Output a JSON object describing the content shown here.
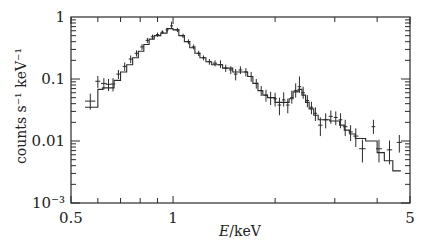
{
  "chart_data": {
    "type": "scatter",
    "title": "",
    "xlabel": "E/keV",
    "xlabel_italic": "E",
    "xlabel_unit": "/keV",
    "ylabel": "counts s⁻¹ keV⁻¹",
    "xscale": "log",
    "yscale": "log",
    "xlim": [
      0.5,
      5
    ],
    "ylim": [
      0.001,
      1
    ],
    "x_tick_labels": [
      {
        "value": 0.5,
        "label": "0.5"
      },
      {
        "value": 1,
        "label": "1"
      },
      {
        "value": 5,
        "label": "5"
      }
    ],
    "y_tick_labels": [
      {
        "value": 1,
        "label": "1"
      },
      {
        "value": 0.1,
        "label": "0.1"
      },
      {
        "value": 0.01,
        "label": "0.01"
      },
      {
        "value": 0.001,
        "label": "10⁻³"
      }
    ],
    "grid": false,
    "legend": null,
    "series": [
      {
        "name": "data",
        "style": "errorbar-crosses",
        "points": [
          {
            "x": 0.57,
            "y": 0.044,
            "xerr": 0.02,
            "yerr_lo": 0.012,
            "yerr_hi": 0.014
          },
          {
            "x": 0.6,
            "y": 0.092,
            "xerr": 0.01,
            "yerr_lo": 0.02,
            "yerr_hi": 0.02
          },
          {
            "x": 0.625,
            "y": 0.085,
            "xerr": 0.012,
            "yerr_lo": 0.018,
            "yerr_hi": 0.018
          },
          {
            "x": 0.645,
            "y": 0.082,
            "xerr": 0.012,
            "yerr_lo": 0.018,
            "yerr_hi": 0.018
          },
          {
            "x": 0.665,
            "y": 0.083,
            "xerr": 0.01,
            "yerr_lo": 0.02,
            "yerr_hi": 0.02
          },
          {
            "x": 0.69,
            "y": 0.12,
            "xerr": 0.01,
            "yerr_lo": 0.02,
            "yerr_hi": 0.02
          },
          {
            "x": 0.72,
            "y": 0.16,
            "xerr": 0.01,
            "yerr_lo": 0.025,
            "yerr_hi": 0.025
          },
          {
            "x": 0.75,
            "y": 0.21,
            "xerr": 0.01,
            "yerr_lo": 0.03,
            "yerr_hi": 0.03
          },
          {
            "x": 0.78,
            "y": 0.26,
            "xerr": 0.01,
            "yerr_lo": 0.03,
            "yerr_hi": 0.03
          },
          {
            "x": 0.81,
            "y": 0.33,
            "xerr": 0.01,
            "yerr_lo": 0.035,
            "yerr_hi": 0.035
          },
          {
            "x": 0.84,
            "y": 0.42,
            "xerr": 0.01,
            "yerr_lo": 0.04,
            "yerr_hi": 0.04
          },
          {
            "x": 0.87,
            "y": 0.48,
            "xerr": 0.01,
            "yerr_lo": 0.04,
            "yerr_hi": 0.04
          },
          {
            "x": 0.9,
            "y": 0.52,
            "xerr": 0.01,
            "yerr_lo": 0.04,
            "yerr_hi": 0.04
          },
          {
            "x": 0.93,
            "y": 0.57,
            "xerr": 0.01,
            "yerr_lo": 0.04,
            "yerr_hi": 0.04
          },
          {
            "x": 0.96,
            "y": 0.62,
            "xerr": 0.01,
            "yerr_lo": 0.05,
            "yerr_hi": 0.05
          },
          {
            "x": 0.99,
            "y": 0.72,
            "xerr": 0.01,
            "yerr_lo": 0.06,
            "yerr_hi": 0.12
          },
          {
            "x": 1.03,
            "y": 0.62,
            "xerr": 0.015,
            "yerr_lo": 0.05,
            "yerr_hi": 0.05
          },
          {
            "x": 1.07,
            "y": 0.5,
            "xerr": 0.015,
            "yerr_lo": 0.04,
            "yerr_hi": 0.04
          },
          {
            "x": 1.11,
            "y": 0.4,
            "xerr": 0.015,
            "yerr_lo": 0.035,
            "yerr_hi": 0.035
          },
          {
            "x": 1.15,
            "y": 0.33,
            "xerr": 0.015,
            "yerr_lo": 0.03,
            "yerr_hi": 0.03
          },
          {
            "x": 1.19,
            "y": 0.26,
            "xerr": 0.015,
            "yerr_lo": 0.025,
            "yerr_hi": 0.025
          },
          {
            "x": 1.23,
            "y": 0.22,
            "xerr": 0.015,
            "yerr_lo": 0.02,
            "yerr_hi": 0.02
          },
          {
            "x": 1.28,
            "y": 0.19,
            "xerr": 0.015,
            "yerr_lo": 0.02,
            "yerr_hi": 0.02
          },
          {
            "x": 1.33,
            "y": 0.18,
            "xerr": 0.02,
            "yerr_lo": 0.02,
            "yerr_hi": 0.02
          },
          {
            "x": 1.38,
            "y": 0.17,
            "xerr": 0.02,
            "yerr_lo": 0.02,
            "yerr_hi": 0.03
          },
          {
            "x": 1.43,
            "y": 0.15,
            "xerr": 0.02,
            "yerr_lo": 0.02,
            "yerr_hi": 0.02
          },
          {
            "x": 1.48,
            "y": 0.14,
            "xerr": 0.02,
            "yerr_lo": 0.02,
            "yerr_hi": 0.02
          },
          {
            "x": 1.53,
            "y": 0.12,
            "xerr": 0.02,
            "yerr_lo": 0.025,
            "yerr_hi": 0.025
          },
          {
            "x": 1.58,
            "y": 0.14,
            "xerr": 0.02,
            "yerr_lo": 0.02,
            "yerr_hi": 0.02
          },
          {
            "x": 1.64,
            "y": 0.13,
            "xerr": 0.02,
            "yerr_lo": 0.02,
            "yerr_hi": 0.02
          },
          {
            "x": 1.7,
            "y": 0.11,
            "xerr": 0.02,
            "yerr_lo": 0.02,
            "yerr_hi": 0.02
          },
          {
            "x": 1.76,
            "y": 0.085,
            "xerr": 0.02,
            "yerr_lo": 0.015,
            "yerr_hi": 0.015
          },
          {
            "x": 1.82,
            "y": 0.065,
            "xerr": 0.02,
            "yerr_lo": 0.012,
            "yerr_hi": 0.012
          },
          {
            "x": 1.88,
            "y": 0.055,
            "xerr": 0.02,
            "yerr_lo": 0.012,
            "yerr_hi": 0.012
          },
          {
            "x": 1.94,
            "y": 0.05,
            "xerr": 0.02,
            "yerr_lo": 0.012,
            "yerr_hi": 0.012
          },
          {
            "x": 2.0,
            "y": 0.048,
            "xerr": 0.025,
            "yerr_lo": 0.012,
            "yerr_hi": 0.012
          },
          {
            "x": 2.06,
            "y": 0.038,
            "xerr": 0.025,
            "yerr_lo": 0.012,
            "yerr_hi": 0.012
          },
          {
            "x": 2.12,
            "y": 0.046,
            "xerr": 0.025,
            "yerr_lo": 0.01,
            "yerr_hi": 0.015
          },
          {
            "x": 2.18,
            "y": 0.038,
            "xerr": 0.025,
            "yerr_lo": 0.01,
            "yerr_hi": 0.01
          },
          {
            "x": 2.24,
            "y": 0.05,
            "xerr": 0.025,
            "yerr_lo": 0.01,
            "yerr_hi": 0.015
          },
          {
            "x": 2.3,
            "y": 0.065,
            "xerr": 0.03,
            "yerr_lo": 0.015,
            "yerr_hi": 0.02
          },
          {
            "x": 2.36,
            "y": 0.075,
            "xerr": 0.03,
            "yerr_lo": 0.015,
            "yerr_hi": 0.035
          },
          {
            "x": 2.42,
            "y": 0.06,
            "xerr": 0.03,
            "yerr_lo": 0.012,
            "yerr_hi": 0.015
          },
          {
            "x": 2.49,
            "y": 0.045,
            "xerr": 0.03,
            "yerr_lo": 0.01,
            "yerr_hi": 0.01
          },
          {
            "x": 2.56,
            "y": 0.035,
            "xerr": 0.03,
            "yerr_lo": 0.008,
            "yerr_hi": 0.008
          },
          {
            "x": 2.63,
            "y": 0.028,
            "xerr": 0.03,
            "yerr_lo": 0.007,
            "yerr_hi": 0.007
          },
          {
            "x": 2.72,
            "y": 0.018,
            "xerr": 0.04,
            "yerr_lo": 0.006,
            "yerr_hi": 0.006
          },
          {
            "x": 2.82,
            "y": 0.022,
            "xerr": 0.04,
            "yerr_lo": 0.006,
            "yerr_hi": 0.006
          },
          {
            "x": 2.92,
            "y": 0.025,
            "xerr": 0.04,
            "yerr_lo": 0.006,
            "yerr_hi": 0.006
          },
          {
            "x": 3.02,
            "y": 0.024,
            "xerr": 0.04,
            "yerr_lo": 0.006,
            "yerr_hi": 0.006
          },
          {
            "x": 3.12,
            "y": 0.022,
            "xerr": 0.04,
            "yerr_lo": 0.006,
            "yerr_hi": 0.006
          },
          {
            "x": 3.22,
            "y": 0.017,
            "xerr": 0.05,
            "yerr_lo": 0.005,
            "yerr_hi": 0.005
          },
          {
            "x": 3.34,
            "y": 0.014,
            "xerr": 0.05,
            "yerr_lo": 0.004,
            "yerr_hi": 0.004
          },
          {
            "x": 3.46,
            "y": 0.012,
            "xerr": 0.06,
            "yerr_lo": 0.004,
            "yerr_hi": 0.004
          },
          {
            "x": 3.62,
            "y": 0.0075,
            "xerr": 0.08,
            "yerr_lo": 0.003,
            "yerr_hi": 0.003
          },
          {
            "x": 3.9,
            "y": 0.017,
            "xerr": 0.05,
            "yerr_lo": 0.004,
            "yerr_hi": 0.005
          },
          {
            "x": 4.05,
            "y": 0.0075,
            "xerr": 0.08,
            "yerr_lo": 0.003,
            "yerr_hi": 0.003
          },
          {
            "x": 4.35,
            "y": 0.0072,
            "xerr": 0.08,
            "yerr_lo": 0.003,
            "yerr_hi": 0.003
          },
          {
            "x": 4.65,
            "y": 0.0095,
            "xerr": 0.08,
            "yerr_lo": 0.003,
            "yerr_hi": 0.003
          }
        ]
      },
      {
        "name": "model",
        "style": "histogram-step",
        "bins": [
          [
            0.55,
            0.6,
            0.035
          ],
          [
            0.6,
            0.62,
            0.068
          ],
          [
            0.62,
            0.67,
            0.072
          ],
          [
            0.67,
            0.7,
            0.095
          ],
          [
            0.7,
            0.73,
            0.13
          ],
          [
            0.73,
            0.76,
            0.17
          ],
          [
            0.76,
            0.79,
            0.22
          ],
          [
            0.79,
            0.82,
            0.28
          ],
          [
            0.82,
            0.85,
            0.36
          ],
          [
            0.85,
            0.88,
            0.44
          ],
          [
            0.88,
            0.92,
            0.5
          ],
          [
            0.92,
            0.96,
            0.55
          ],
          [
            0.96,
            1.0,
            0.65
          ],
          [
            1.0,
            1.04,
            0.62
          ],
          [
            1.04,
            1.08,
            0.5
          ],
          [
            1.08,
            1.12,
            0.4
          ],
          [
            1.12,
            1.16,
            0.32
          ],
          [
            1.16,
            1.2,
            0.26
          ],
          [
            1.2,
            1.25,
            0.22
          ],
          [
            1.25,
            1.3,
            0.19
          ],
          [
            1.3,
            1.4,
            0.17
          ],
          [
            1.4,
            1.5,
            0.15
          ],
          [
            1.5,
            1.56,
            0.13
          ],
          [
            1.56,
            1.66,
            0.13
          ],
          [
            1.66,
            1.72,
            0.11
          ],
          [
            1.72,
            1.78,
            0.085
          ],
          [
            1.78,
            1.84,
            0.065
          ],
          [
            1.84,
            1.9,
            0.055
          ],
          [
            1.9,
            2.0,
            0.05
          ],
          [
            2.0,
            2.2,
            0.042
          ],
          [
            2.2,
            2.26,
            0.048
          ],
          [
            2.26,
            2.34,
            0.062
          ],
          [
            2.34,
            2.4,
            0.068
          ],
          [
            2.4,
            2.46,
            0.055
          ],
          [
            2.46,
            2.52,
            0.042
          ],
          [
            2.52,
            2.6,
            0.033
          ],
          [
            2.6,
            2.68,
            0.026
          ],
          [
            2.68,
            2.9,
            0.022
          ],
          [
            2.9,
            3.1,
            0.021
          ],
          [
            3.1,
            3.2,
            0.018
          ],
          [
            3.2,
            3.32,
            0.015
          ],
          [
            3.32,
            3.45,
            0.013
          ],
          [
            3.45,
            3.7,
            0.011
          ],
          [
            3.7,
            4.0,
            0.01
          ],
          [
            4.0,
            4.2,
            0.0065
          ],
          [
            4.2,
            4.45,
            0.0048
          ],
          [
            4.45,
            4.7,
            0.0033
          ]
        ]
      }
    ]
  }
}
